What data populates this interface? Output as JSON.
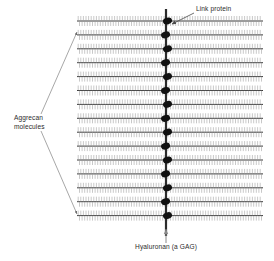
{
  "figure": {
    "title_internal": "Aggrecan aggregate on hyaluronan backbone",
    "width": 274,
    "height": 261,
    "background_color": "#ffffff"
  },
  "labels": {
    "link_protein": {
      "text": "Link protein",
      "x": 196,
      "y": 11,
      "anchor": "start"
    },
    "aggrecan_line1": {
      "text": "Aggrecan",
      "x": 14,
      "y": 120,
      "anchor": "start"
    },
    "aggrecan_line2": {
      "text": "molecules",
      "x": 14,
      "y": 129,
      "anchor": "start"
    },
    "hyaluronan": {
      "text": "Hyaluronan (a GAG)",
      "x": 166,
      "y": 249,
      "anchor": "middle"
    }
  },
  "leaders": {
    "link_protein_arrow": {
      "from_x": 194,
      "from_y": 13,
      "to_x": 172,
      "to_y": 24,
      "color": "#4a4a4a"
    },
    "aggrecan_arrow_upper": {
      "from_x": 41,
      "from_y": 114,
      "to_x": 77,
      "to_y": 32,
      "color": "#6b6b6b"
    },
    "aggrecan_arrow_lower": {
      "from_x": 41,
      "from_y": 131,
      "to_x": 77,
      "to_y": 214,
      "color": "#6b6b6b"
    },
    "hyaluronan_arrow": {
      "from_x": 166,
      "from_y": 243,
      "to_x": 166,
      "to_y": 229,
      "color": "#8a8a8a"
    }
  },
  "backbone": {
    "name": "hyaluronan-backbone",
    "x": 166,
    "top_y": 9,
    "bottom_y": 236,
    "width": 2.2,
    "color": "#2b2b2b"
  },
  "link_proteins": {
    "count": 15,
    "color": "#111111",
    "rx": 4.6,
    "ry": 3.3,
    "first_y": 21,
    "spacing": 13.9,
    "x_offset": 1.5
  },
  "aggrecan": {
    "rows": 15,
    "first_y": 21,
    "spacing": 13.9,
    "left_x": 77,
    "right_x": 263,
    "core_color": "#3a3a3a",
    "core_width": 1.0,
    "bristle_color": "#9a9a9a",
    "bristle_width": 0.55,
    "bristle_spacing": 2.6,
    "bristle_up": 5.0,
    "bristle_down": 5.0
  },
  "colors": {
    "ink": "#2b2b2b",
    "bristle": "#9a9a9a",
    "link_protein": "#111111",
    "leader": "#6b6b6b",
    "background": "#ffffff"
  }
}
